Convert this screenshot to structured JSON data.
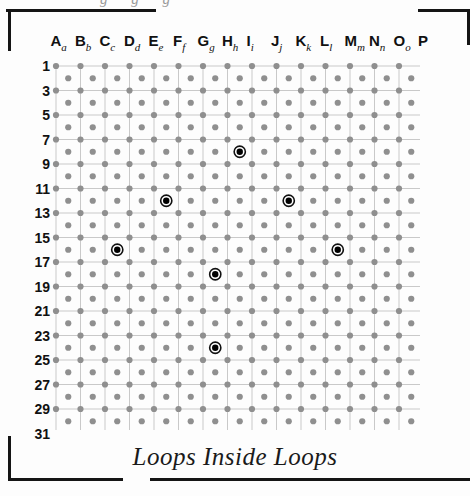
{
  "document": {
    "caption": "Loops Inside Loops",
    "ghost_header": "g g g"
  },
  "grid": {
    "columns": [
      {
        "letter": "A",
        "sub": "a"
      },
      {
        "letter": "B",
        "sub": "b"
      },
      {
        "letter": "C",
        "sub": "c"
      },
      {
        "letter": "D",
        "sub": "d"
      },
      {
        "letter": "E",
        "sub": "e"
      },
      {
        "letter": "F",
        "sub": "f"
      },
      {
        "letter": "G",
        "sub": "g"
      },
      {
        "letter": "H",
        "sub": "h"
      },
      {
        "letter": "I",
        "sub": "i"
      },
      {
        "letter": "J",
        "sub": "j"
      },
      {
        "letter": "K",
        "sub": "k"
      },
      {
        "letter": "L",
        "sub": "l"
      },
      {
        "letter": "M",
        "sub": "m"
      },
      {
        "letter": "N",
        "sub": "n"
      },
      {
        "letter": "O",
        "sub": "o"
      },
      {
        "letter": "P",
        "sub": ""
      }
    ],
    "row_labels": [
      "1",
      "3",
      "5",
      "7",
      "9",
      "11",
      "13",
      "15",
      "17",
      "19",
      "21",
      "23",
      "25",
      "27",
      "29",
      "31"
    ],
    "row_count": 31,
    "col_count": 16,
    "dot_color": "#8f8f8f",
    "gridline_color": "#c9c9c9",
    "marker_ring_color": "#111111",
    "marker_fill_color": "#000000",
    "markers": [
      {
        "col": "h",
        "row": 8,
        "label": "h8"
      },
      {
        "col": "e",
        "row": 12,
        "label": "e12"
      },
      {
        "col": "j",
        "row": 12,
        "label": "j12"
      },
      {
        "col": "c",
        "row": 16,
        "label": "c16"
      },
      {
        "col": "l",
        "row": 16,
        "label": "l16"
      },
      {
        "col": "g",
        "row": 18,
        "label": "g18"
      },
      {
        "col": "g",
        "row": 24,
        "label": "g24"
      }
    ]
  }
}
